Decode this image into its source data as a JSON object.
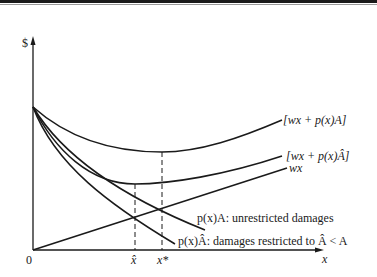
{
  "diagram": {
    "y_axis_label": "$",
    "x_axis_label": "x",
    "origin_label": "0",
    "x_ticks": [
      {
        "id": "x_hat",
        "label": "x̂"
      },
      {
        "id": "x_star",
        "label": "x*"
      }
    ],
    "curves": [
      {
        "id": "total_unrestricted",
        "label": "[wx + p(x)A]"
      },
      {
        "id": "total_restricted",
        "label": "[wx + p(x)Â]"
      },
      {
        "id": "care_cost",
        "label": "wx"
      },
      {
        "id": "damages_unrestricted",
        "label": "p(x)A: unrestricted damages"
      },
      {
        "id": "damages_restricted",
        "label": "p(x)Â: damages restricted to Â < A"
      }
    ]
  }
}
